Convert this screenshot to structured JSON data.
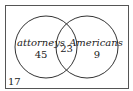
{
  "diagram": {
    "type": "venn",
    "sets": [
      {
        "label": "attorneys",
        "only_count": "45"
      },
      {
        "label": "Americans",
        "only_count": "9"
      }
    ],
    "intersection_count": "23",
    "outside_count": "17"
  },
  "colors": {
    "stroke": "#333333",
    "frame": "#555555",
    "background": "#ffffff"
  }
}
